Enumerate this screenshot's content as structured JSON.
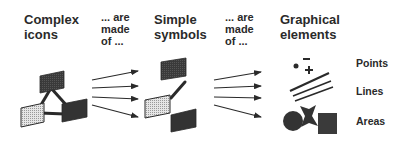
{
  "columns": {
    "complex_icons": {
      "title": "Complex\nicons"
    },
    "connector_1": {
      "text": "... are\nmade\nof ..."
    },
    "simple_symbols": {
      "title": "Simple\nsymbols"
    },
    "connector_2": {
      "text": "... are\nmade\nof ..."
    },
    "graphical_elements": {
      "title": "Graphical\nelements"
    }
  },
  "element_labels": [
    {
      "label": "Points"
    },
    {
      "label": "Lines"
    },
    {
      "label": "Areas"
    }
  ],
  "colors": {
    "dark_fill": "#3a3a3a",
    "stipple_fill": "#dcdcdc",
    "stroke": "#2a2a2a",
    "text": "#2a2a2a"
  }
}
